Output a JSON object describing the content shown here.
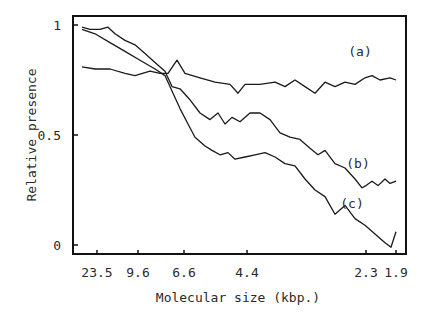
{
  "chart_data": {
    "type": "line",
    "title": "",
    "xlabel": "Molecular size (kbp.)",
    "ylabel": "Relative presence",
    "x_tick_labels": [
      "23.5",
      "9.6",
      "6.6",
      "4.4",
      "2.3",
      "1.9"
    ],
    "y_tick_labels": [
      "1",
      "0.5",
      "0"
    ],
    "ylim": [
      0,
      1
    ],
    "grid": false,
    "legend": "inline labels",
    "series": [
      {
        "name": "(a)",
        "x": [
          82,
          95,
          110,
          125,
          135,
          150,
          160,
          168,
          177,
          185,
          200,
          215,
          230,
          238,
          245,
          260,
          275,
          285,
          295,
          305,
          315,
          325,
          335,
          345,
          355,
          365,
          372,
          380,
          390,
          396
        ],
        "values": [
          0.81,
          0.8,
          0.8,
          0.78,
          0.77,
          0.79,
          0.78,
          0.78,
          0.84,
          0.78,
          0.76,
          0.74,
          0.73,
          0.69,
          0.73,
          0.73,
          0.74,
          0.72,
          0.75,
          0.72,
          0.69,
          0.74,
          0.72,
          0.74,
          0.73,
          0.76,
          0.77,
          0.75,
          0.76,
          0.75
        ]
      },
      {
        "name": "(b)",
        "x": [
          82,
          90,
          100,
          108,
          115,
          125,
          135,
          145,
          155,
          165,
          172,
          180,
          190,
          200,
          210,
          218,
          225,
          232,
          240,
          250,
          260,
          270,
          280,
          290,
          300,
          310,
          318,
          325,
          335,
          345,
          355,
          362,
          366,
          372,
          378,
          385,
          390,
          396
        ],
        "values": [
          0.99,
          0.98,
          0.98,
          0.99,
          0.96,
          0.93,
          0.91,
          0.87,
          0.83,
          0.79,
          0.72,
          0.71,
          0.66,
          0.6,
          0.57,
          0.6,
          0.55,
          0.58,
          0.56,
          0.6,
          0.6,
          0.57,
          0.51,
          0.49,
          0.48,
          0.44,
          0.41,
          0.43,
          0.37,
          0.35,
          0.3,
          0.26,
          0.27,
          0.29,
          0.27,
          0.3,
          0.28,
          0.29
        ]
      },
      {
        "name": "(c)",
        "x": [
          82,
          95,
          110,
          125,
          140,
          155,
          165,
          172,
          180,
          188,
          195,
          205,
          212,
          220,
          228,
          235,
          245,
          255,
          265,
          275,
          285,
          295,
          305,
          315,
          325,
          335,
          345,
          355,
          365,
          375,
          385,
          391,
          396
        ],
        "values": [
          0.98,
          0.96,
          0.92,
          0.88,
          0.84,
          0.8,
          0.77,
          0.7,
          0.62,
          0.55,
          0.49,
          0.45,
          0.43,
          0.41,
          0.42,
          0.39,
          0.4,
          0.41,
          0.42,
          0.4,
          0.37,
          0.36,
          0.3,
          0.25,
          0.22,
          0.14,
          0.18,
          0.12,
          0.09,
          0.05,
          0.01,
          -0.01,
          0.06
        ]
      }
    ],
    "annotations": [
      {
        "text": "(a)",
        "x": 360,
        "y": 0.86
      },
      {
        "text": "(b)",
        "x": 358,
        "y": 0.35
      },
      {
        "text": "(c)",
        "x": 352,
        "y": 0.17
      }
    ]
  },
  "plot": {
    "frame": {
      "left": 73,
      "top": 16,
      "right": 406,
      "bottom": 254
    },
    "y_zero_px": 245,
    "y_one_px": 25,
    "x_ticks_px": [
      97,
      138,
      184,
      247,
      366,
      396
    ],
    "line_color": "#1a1a1a"
  }
}
